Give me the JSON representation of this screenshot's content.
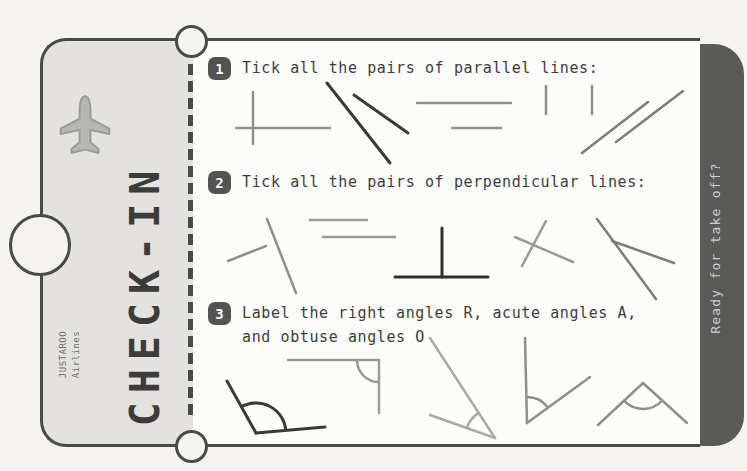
{
  "colors": {
    "page_bg": "#f4f3f0",
    "ticket_gray": "#e3e2de",
    "ticket_white": "#fcfcfa",
    "border_dark": "#4a4a48",
    "stub_dark": "#5a5a58",
    "line_gray": "#8f8f8d",
    "line_dark": "#3a3a38"
  },
  "ticket": {
    "title": "CHECK-IN",
    "airline": {
      "name": "JUSTAROO",
      "sub": "Airlines"
    },
    "stub_label": "Ready for take off?",
    "questions": [
      {
        "number": "1",
        "text": "Tick all the pairs of parallel lines:"
      },
      {
        "number": "2",
        "text": "Tick all the pairs of perpendicular lines:"
      },
      {
        "number": "3",
        "text": "Label the right angles R, acute angles A,",
        "text_line2": "and obtuse angles O"
      }
    ]
  },
  "figures": [
    {
      "name": "q1-cross-pair",
      "stroke": "#8f8f8d",
      "width": 2.5,
      "segments": [
        [
          253,
          92,
          253,
          144
        ],
        [
          236,
          128,
          330,
          128
        ]
      ]
    },
    {
      "name": "q1-converging-pair",
      "stroke": "#3a3a38",
      "width": 3,
      "segments": [
        [
          327,
          83,
          390,
          163
        ],
        [
          354,
          95,
          408,
          133
        ]
      ]
    },
    {
      "name": "q1-horizontal-pair",
      "stroke": "#8f8f8d",
      "width": 2.5,
      "segments": [
        [
          417,
          103,
          511,
          103
        ],
        [
          452,
          128,
          501,
          128
        ]
      ]
    },
    {
      "name": "q1-vertical-pair",
      "stroke": "#8f8f8d",
      "width": 2.5,
      "segments": [
        [
          546,
          86,
          546,
          114
        ],
        [
          592,
          86,
          592,
          114
        ]
      ]
    },
    {
      "name": "q1-diagonal-pair",
      "stroke": "#7c7c7a",
      "width": 2.5,
      "segments": [
        [
          582,
          153,
          648,
          102
        ],
        [
          616,
          142,
          683,
          91
        ]
      ]
    },
    {
      "name": "q2-tilted-pair",
      "stroke": "#8f8f8d",
      "width": 2.5,
      "segments": [
        [
          267,
          219,
          296,
          293
        ],
        [
          228,
          261,
          266,
          246
        ]
      ]
    },
    {
      "name": "q2-horizontal-pair",
      "stroke": "#9a9a98",
      "width": 2.5,
      "segments": [
        [
          310,
          220,
          367,
          220
        ],
        [
          323,
          237,
          395,
          237
        ]
      ]
    },
    {
      "name": "q2-perpendicular-t",
      "stroke": "#2e2e2c",
      "width": 3,
      "segments": [
        [
          442,
          228,
          442,
          277
        ],
        [
          395,
          277,
          488,
          277
        ]
      ]
    },
    {
      "name": "q2-crossing-pair",
      "stroke": "#9a9a98",
      "width": 2.5,
      "segments": [
        [
          546,
          221,
          522,
          266
        ],
        [
          515,
          237,
          573,
          262
        ]
      ]
    },
    {
      "name": "q2-v-pair",
      "stroke": "#7c7c7a",
      "width": 2.5,
      "segments": [
        [
          597,
          219,
          656,
          299
        ],
        [
          612,
          241,
          674,
          263
        ]
      ]
    },
    {
      "name": "q3-angle-1",
      "stroke": "#3a3a38",
      "width": 3,
      "segments": [
        [
          256,
          433,
          227,
          381
        ],
        [
          256,
          433,
          325,
          427
        ]
      ],
      "arcs": [
        "M 241.4 406.8 A 30 30 0 0 1 285.9 430.4"
      ]
    },
    {
      "name": "q3-angle-2",
      "stroke": "#9a9a98",
      "width": 2.5,
      "segments": [
        [
          288,
          360,
          379,
          360
        ],
        [
          379,
          360,
          379,
          413
        ]
      ],
      "arcs": [
        "M 357 360 A 22 22 0 0 0 379 382"
      ]
    },
    {
      "name": "q3-angle-3",
      "stroke": "#a9a9a7",
      "width": 2.5,
      "segments": [
        [
          495,
          438,
          430,
          338
        ],
        [
          495,
          438,
          430,
          415
        ]
      ],
      "arcs": [
        "M 478.7 412.9 A 30 30 0 0 0 466.7 428"
      ]
    },
    {
      "name": "q3-angle-4",
      "stroke": "#8f8f8d",
      "width": 2.5,
      "segments": [
        [
          525,
          338,
          527,
          423
        ],
        [
          527,
          423,
          590,
          377
        ]
      ],
      "arcs": [
        "M 526.4 397 A 26 26 0 0 1 548 407.7"
      ]
    },
    {
      "name": "q3-angle-5",
      "stroke": "#8f8f8d",
      "width": 2.5,
      "segments": [
        [
          643,
          383,
          598,
          425
        ],
        [
          643,
          383,
          687,
          423
        ]
      ],
      "arcs": [
        "M 624 400.7 A 26 26 0 0 0 662.2 400.5"
      ]
    }
  ]
}
